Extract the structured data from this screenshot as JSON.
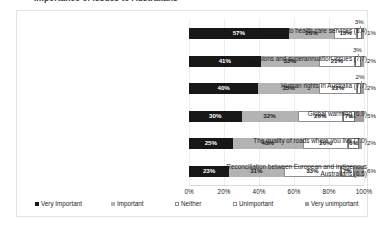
{
  "title_clipped": "Importance of issues to Australians",
  "chart_data": {
    "type": "bar",
    "subtype": "100% stacked horizontal bar",
    "title": "Importance of issues to Australians",
    "xlabel": "",
    "ylabel": "",
    "xlim": [
      0,
      100
    ],
    "xticks": [
      "0%",
      "20%",
      "40%",
      "60%",
      "80%",
      "100%"
    ],
    "xtick_values": [
      0,
      20,
      40,
      60,
      80,
      100
    ],
    "grid": true,
    "legend_position": "bottom",
    "categories": [
      "Access to health care services (8.4)",
      "Pensions and superannuation issues (7.7)",
      "Human rights in Australia (7.7)",
      "Global warming (6.9)",
      "The quality of roads where you live (7.0)",
      "Reconciliation between European and Indigenous\nAustralians (6.5)"
    ],
    "series": [
      {
        "name": "Very Important",
        "color": "#171717",
        "values": [
          57,
          41,
          40,
          30,
          25,
          23
        ]
      },
      {
        "name": "Important",
        "color": "#b3b3b3",
        "values": [
          26,
          33,
          35,
          32,
          40,
          31
        ]
      },
      {
        "name": "Neither",
        "color": "#ffffff",
        "values": [
          13,
          21,
          22,
          26,
          26,
          33
        ]
      },
      {
        "name": "Unimportant",
        "color": "#ffffff",
        "values": [
          3,
          3,
          2,
          7,
          6,
          7
        ]
      },
      {
        "name": "Very unimportant",
        "color": "#9e9e9e",
        "values": [
          1,
          2,
          2,
          5,
          2,
          6
        ]
      }
    ],
    "data_labels": [
      [
        "57%",
        "26%",
        "13%",
        "3%",
        "1%"
      ],
      [
        "41%",
        "33%",
        "21%",
        "3%",
        "2%"
      ],
      [
        "40%",
        "35%",
        "22%",
        "2%",
        "2%"
      ],
      [
        "30%",
        "32%",
        "26%",
        "7%",
        "5%"
      ],
      [
        "25%",
        "40%",
        "26%",
        "6%",
        "2%"
      ],
      [
        "23%",
        "31%",
        "33%",
        "7%",
        "6%"
      ]
    ]
  }
}
